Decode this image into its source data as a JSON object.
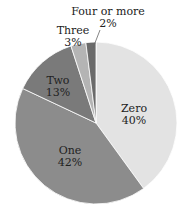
{
  "chart_data": {
    "type": "pie",
    "title": "",
    "slices": [
      {
        "label": "Zero",
        "value": 40,
        "display": "40%",
        "color": "#e3e3e3"
      },
      {
        "label": "One",
        "value": 42,
        "display": "42%",
        "color": "#8c8c8c"
      },
      {
        "label": "Two",
        "value": 13,
        "display": "13%",
        "color": "#7a7a7a"
      },
      {
        "label": "Three",
        "value": 3,
        "display": "3%",
        "color": "#b4b4b4"
      },
      {
        "label": "Four or more",
        "value": 2,
        "display": "2%",
        "color": "#6a6a6a"
      }
    ],
    "start_angle_deg": 0,
    "direction": "clockwise",
    "legend": "none"
  },
  "labels": {
    "zero": {
      "name": "Zero",
      "pct": "40%"
    },
    "one": {
      "name": "One",
      "pct": "42%"
    },
    "two": {
      "name": "Two",
      "pct": "13%"
    },
    "three": {
      "name": "Three",
      "pct": "3%"
    },
    "four": {
      "name": "Four or more",
      "pct": "2%"
    }
  }
}
